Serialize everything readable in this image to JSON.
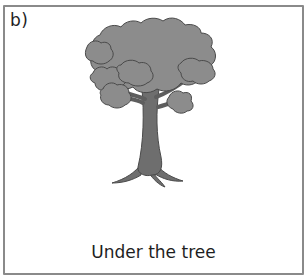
{
  "card": {
    "label": "b)",
    "caption": "Under the tree",
    "illustration": {
      "subject": "tree-icon",
      "canopy_color": "#8c8c8c",
      "trunk_color": "#6e6e6e",
      "outline_color": "#4a4a4a"
    },
    "border_color": "#8a8a8a"
  }
}
